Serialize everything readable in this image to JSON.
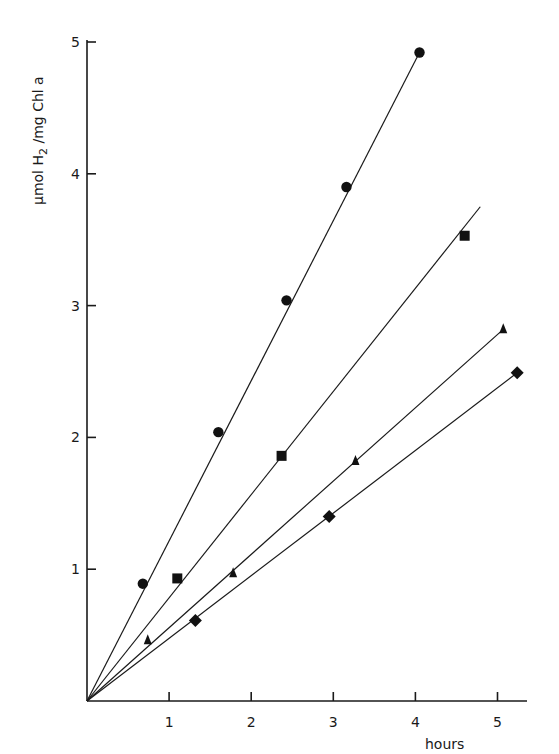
{
  "chart_data": {
    "type": "scatter",
    "title": "",
    "xlabel": "hours",
    "ylabel": "µmol H2 /mg Chl a",
    "ylabel_parts": {
      "pre": "µmol H",
      "sub": "2",
      "post": " /mg Chl a"
    },
    "xlim": [
      0,
      5.4
    ],
    "ylim": [
      0,
      5
    ],
    "xticks": [
      1,
      2,
      3,
      4,
      5
    ],
    "yticks": [
      1,
      2,
      3,
      4,
      5
    ],
    "grid": false,
    "legend": null,
    "series": [
      {
        "name": "circles",
        "marker": "circle",
        "points": [
          [
            0.68,
            0.89
          ],
          [
            1.6,
            2.04
          ],
          [
            2.43,
            3.04
          ],
          [
            3.16,
            3.9
          ],
          [
            4.05,
            4.92
          ]
        ],
        "fit_line": [
          [
            0,
            0
          ],
          [
            4.05,
            4.92
          ]
        ]
      },
      {
        "name": "squares",
        "marker": "square",
        "points": [
          [
            1.1,
            0.93
          ],
          [
            2.37,
            1.86
          ],
          [
            4.6,
            3.53
          ]
        ],
        "fit_line": [
          [
            0,
            0
          ],
          [
            4.79,
            3.75
          ]
        ]
      },
      {
        "name": "triangles",
        "marker": "triangle",
        "points": [
          [
            0.74,
            0.46
          ],
          [
            1.78,
            0.97
          ],
          [
            3.27,
            1.82
          ],
          [
            5.07,
            2.82
          ]
        ],
        "fit_line": [
          [
            0,
            0
          ],
          [
            5.07,
            2.82
          ]
        ]
      },
      {
        "name": "diamonds",
        "marker": "diamond",
        "points": [
          [
            1.32,
            0.61
          ],
          [
            2.95,
            1.4
          ],
          [
            5.24,
            2.49
          ]
        ],
        "fit_line": [
          [
            0,
            0
          ],
          [
            5.24,
            2.49
          ]
        ]
      }
    ]
  },
  "layout": {
    "origin_px": [
      87,
      701
    ],
    "px_per_x": 82.1,
    "px_per_y": 131.8,
    "x_axis_end_px": 527,
    "y_axis_top_px": 40,
    "ink_color": "#1a1a1a"
  }
}
